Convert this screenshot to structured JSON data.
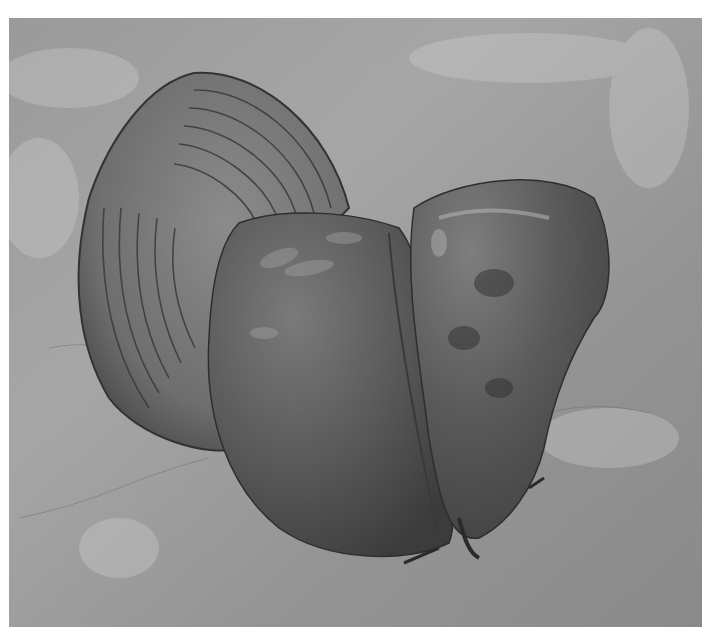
{
  "image": {
    "subject": "Red cabbage halves on textured plaster surface",
    "description": "Grayscale photograph: one cut half of a cabbage showing concentric leaf layers (left), and two whole leafy cabbage wedges overlapping (center/right) on a rough light-gray plaster background.",
    "colors": {
      "background": "#8e8e8e",
      "background_light": "#b4b4b4",
      "cabbage_dark": "#3a3a3a",
      "cabbage_mid": "#5a5a5a",
      "cabbage_highlight": "#9a9a9a",
      "cross_section_light": "#8a8a8a",
      "page_border": "#ffffff"
    }
  }
}
